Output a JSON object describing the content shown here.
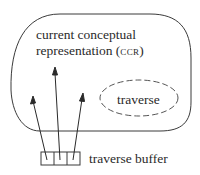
{
  "diagram": {
    "outer_region": {
      "label_line1": "current conceptual",
      "label_line2_main": "representation (",
      "label_line2_abbr": "ccr",
      "label_line2_end": ")"
    },
    "inner_region": {
      "label": "traverse",
      "style": "dashed"
    },
    "buffer": {
      "label": "traverse buffer",
      "cells": 3
    },
    "arrows": [
      {
        "from": "buffer-cell-1",
        "to": "ccr"
      },
      {
        "from": "buffer-cell-2",
        "to": "ccr"
      },
      {
        "from": "buffer-cell-3",
        "to": "ccr"
      }
    ],
    "colors": {
      "line": "#3a3a3a",
      "background": "#ffffff"
    }
  }
}
